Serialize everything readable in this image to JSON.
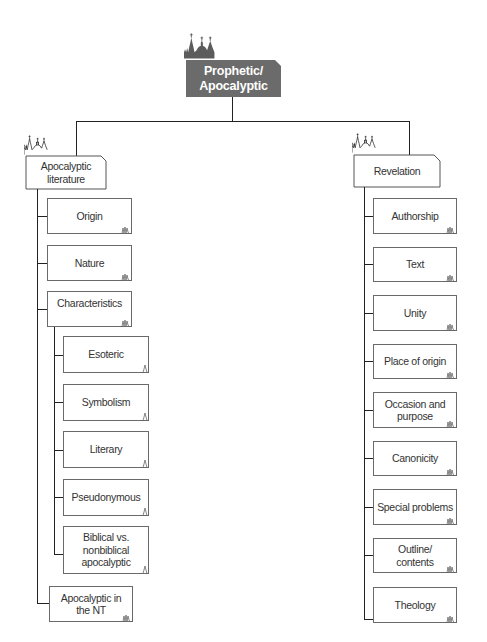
{
  "diagram": {
    "title_clipped": "",
    "colors": {
      "root_fill": "#6b6b6b",
      "root_text": "#ffffff",
      "box_border": "#6a6a6a",
      "connector": "#222222"
    },
    "root": {
      "label_line1": "Prophetic/",
      "label_line2": "Apocalyptic",
      "icon": "church-skyline-icon"
    },
    "branches": [
      {
        "label_line1": "Apocalyptic",
        "label_line2": "literature",
        "icon": "church-skyline-icon",
        "children": [
          {
            "label": "Origin"
          },
          {
            "label": "Nature"
          },
          {
            "label": "Characteristics",
            "children": [
              {
                "label": "Esoteric"
              },
              {
                "label": "Symbolism"
              },
              {
                "label": "Literary"
              },
              {
                "label": "Pseudonymous"
              },
              {
                "label_line1": "Biblical vs.",
                "label_line2": "nonbiblical",
                "label_line3": "apocalyptic"
              }
            ]
          },
          {
            "label_line1": "Apocalyptic in",
            "label_line2": "the NT"
          }
        ]
      },
      {
        "label": "Revelation",
        "icon": "church-skyline-icon",
        "children": [
          {
            "label": "Authorship"
          },
          {
            "label": "Text"
          },
          {
            "label": "Unity"
          },
          {
            "label": "Place of origin"
          },
          {
            "label_line1": "Occasion and",
            "label_line2": "purpose"
          },
          {
            "label": "Canonicity"
          },
          {
            "label": "Special problems"
          },
          {
            "label_line1": "Outline/",
            "label_line2": "contents"
          },
          {
            "label": "Theology"
          }
        ]
      }
    ]
  }
}
